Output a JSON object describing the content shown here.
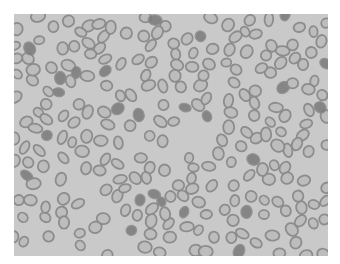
{
  "image": {
    "subject": "blood smear micrograph showing red blood cells",
    "palette": {
      "background": "#c9c9c9",
      "cell_ring": "#8a8a8a",
      "cell_center": "#bdbdbd",
      "dense_cell": "#7a7a7a"
    },
    "frame": {
      "x": 14,
      "y": 14,
      "width": 314,
      "height": 242
    },
    "approx_cell_count": 260,
    "cell_layout_note": "procedurally generated approximation; positions are not traced from the photo"
  }
}
